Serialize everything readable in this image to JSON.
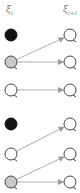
{
  "labels": {
    "left": "ξ",
    "left_sub": "t",
    "right": "ξ",
    "right_sub": "t+1"
  },
  "colors": {
    "black": "#111111",
    "gray": "#c8c8c8",
    "white": "#ffffff",
    "stroke": "#444444",
    "arrow": "#999999"
  },
  "left_nodes": [
    {
      "y": 35,
      "fill": "black"
    },
    {
      "y": 62,
      "fill": "gray"
    },
    {
      "y": 90,
      "fill": "white"
    },
    {
      "y": 124,
      "fill": "black"
    },
    {
      "y": 154,
      "fill": "white"
    },
    {
      "y": 182,
      "fill": "gray"
    }
  ],
  "right_nodes": [
    {
      "y": 35,
      "fill": "white"
    },
    {
      "y": 62,
      "fill": "white"
    },
    {
      "y": 90,
      "fill": "white"
    },
    {
      "y": 124,
      "fill": "white"
    },
    {
      "y": 154,
      "fill": "white"
    },
    {
      "y": 182,
      "fill": "white"
    }
  ],
  "edges": [
    {
      "from": 1,
      "to": 0
    },
    {
      "from": 1,
      "to": 1
    },
    {
      "from": 2,
      "to": 2
    },
    {
      "from": 4,
      "to": 3
    },
    {
      "from": 5,
      "to": 4
    },
    {
      "from": 5,
      "to": 5
    }
  ]
}
